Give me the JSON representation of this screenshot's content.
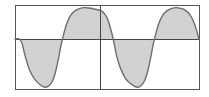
{
  "figure": {
    "title": "",
    "background_color": "#ffffff",
    "width": 209,
    "height": 97
  },
  "frame": {
    "name": "plot-frame",
    "left": 15,
    "top": 5,
    "right": 199,
    "bottom": 89,
    "stroke_color": "#555555",
    "stroke_width": 1
  },
  "axes": {
    "zero_line": {
      "name": "horizontal-zero-axis",
      "y": 39,
      "x_start": 15,
      "x_end": 199,
      "stroke_color": "#444444"
    },
    "period_divider": {
      "name": "vertical-period-divider",
      "x": 100,
      "y_start": 5,
      "y_end": 89,
      "stroke_color": "#444444"
    }
  },
  "curve": {
    "name": "waveform-curve",
    "stroke_color": "#6e6e6e",
    "stroke_width": 1.4,
    "fill_color": "#d2d2d2",
    "fill_opacity": 1
  },
  "chart_data": {
    "type": "area",
    "title": "",
    "subtitle": "",
    "xlabel": "",
    "ylabel": "",
    "xlim": [
      0,
      2
    ],
    "ylim": [
      -1.12,
      0.92
    ],
    "grid": false,
    "legend": null,
    "annotations": [],
    "xticks": [
      0,
      1,
      2
    ],
    "xticklabels": [
      "",
      "",
      ""
    ],
    "yticks": [
      0
    ],
    "yticklabels": [
      ""
    ],
    "series": [
      {
        "name": "waveform",
        "x": [
          0.0,
          0.05,
          0.08,
          0.1,
          0.13,
          0.16,
          0.2,
          0.24,
          0.27,
          0.3,
          0.33,
          0.36,
          0.39,
          0.42,
          0.45,
          0.48,
          0.5,
          0.53,
          0.56,
          0.6,
          0.65,
          0.7,
          0.75,
          0.8,
          0.85,
          0.9,
          0.94,
          0.96,
          0.98,
          1.0,
          1.02,
          1.05,
          1.08,
          1.1,
          1.13,
          1.16,
          1.2,
          1.24,
          1.27,
          1.3,
          1.33,
          1.36,
          1.39,
          1.42,
          1.45,
          1.48,
          1.5,
          1.53,
          1.56,
          1.6,
          1.65,
          1.7,
          1.75,
          1.8,
          1.85,
          1.9,
          1.94,
          1.97,
          2.0
        ],
        "y": [
          0.0,
          0.0,
          -0.12,
          -0.3,
          -0.52,
          -0.7,
          -0.86,
          -0.96,
          -1.02,
          -1.06,
          -1.08,
          -1.06,
          -1.0,
          -0.88,
          -0.66,
          -0.36,
          -0.14,
          0.14,
          0.4,
          0.62,
          0.76,
          0.82,
          0.85,
          0.84,
          0.82,
          0.79,
          0.76,
          0.72,
          0.66,
          0.58,
          0.44,
          0.18,
          -0.12,
          -0.34,
          -0.56,
          -0.72,
          -0.88,
          -0.97,
          -1.02,
          -1.06,
          -1.08,
          -1.06,
          -1.0,
          -0.88,
          -0.66,
          -0.36,
          -0.14,
          0.14,
          0.4,
          0.62,
          0.76,
          0.82,
          0.85,
          0.83,
          0.78,
          0.66,
          0.48,
          0.26,
          0.0
        ]
      }
    ]
  }
}
